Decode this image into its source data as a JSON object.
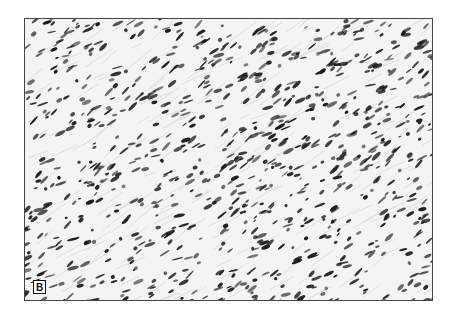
{
  "figure": {
    "type": "histology-micrograph",
    "panel_label": "B",
    "colors": {
      "background": "#ffffff",
      "tissue": "#f4f4f4",
      "stroma": "#d8d8d8",
      "nuclei": "#1a1a1a",
      "border": "#444444"
    }
  }
}
